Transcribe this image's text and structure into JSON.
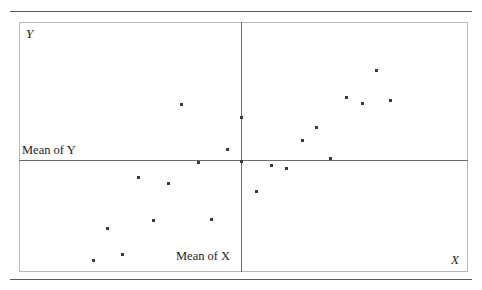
{
  "figure": {
    "background": "#ffffff",
    "rules": {
      "color": "#5a5a5a",
      "top_label": "top-rule",
      "bottom_label": "bottom-rule"
    },
    "frame_color": "#b9b9b9",
    "mean_line_color": "#6b6b6b",
    "point_color": "#3a3a3a"
  },
  "labels": {
    "y_axis": "Y",
    "x_axis": "X",
    "mean_of_y": "Mean of Y",
    "mean_of_x": "Mean of X"
  },
  "chart_data": {
    "type": "scatter",
    "title": "",
    "subtitle": "",
    "xlabel": "X",
    "ylabel": "Y",
    "xlim": [
      0,
      100
    ],
    "ylim": [
      0,
      100
    ],
    "grid": false,
    "legend": null,
    "annotations": [
      {
        "text": "Mean of Y",
        "kind": "horizontal-reference-line-label",
        "line_value_y": 44.8,
        "position": "left-above-line"
      },
      {
        "text": "Mean of X",
        "kind": "vertical-reference-line-label",
        "line_value_x": 49.4,
        "position": "bottom-left-of-line"
      }
    ],
    "reference_lines": [
      {
        "name": "mean-of-y",
        "orientation": "horizontal",
        "value": 44.8
      },
      {
        "name": "mean-of-x",
        "orientation": "vertical",
        "value": 49.4
      }
    ],
    "series": [
      {
        "name": "observations",
        "marker": "square",
        "color": "#3a3a3a",
        "points": [
          {
            "x": 16.5,
            "y": 4.8,
            "px": 93,
            "py": 260,
            "quadrant": "lower-left"
          },
          {
            "x": 19.6,
            "y": 17.6,
            "px": 107,
            "py": 228,
            "quadrant": "lower-left"
          },
          {
            "x": 22.9,
            "y": 7.2,
            "px": 122,
            "py": 254,
            "quadrant": "lower-left"
          },
          {
            "x": 26.5,
            "y": 38.0,
            "px": 138,
            "py": 177,
            "quadrant": "lower-left"
          },
          {
            "x": 29.8,
            "y": 20.8,
            "px": 153,
            "py": 220,
            "quadrant": "lower-left"
          },
          {
            "x": 33.2,
            "y": 35.6,
            "px": 168,
            "py": 183,
            "quadrant": "lower-left"
          },
          {
            "x": 36.1,
            "y": 67.2,
            "px": 181,
            "py": 104,
            "quadrant": "upper-left"
          },
          {
            "x": 39.9,
            "y": 44.0,
            "px": 198,
            "py": 162,
            "quadrant": "lower-left"
          },
          {
            "x": 42.8,
            "y": 21.2,
            "px": 211,
            "py": 219,
            "quadrant": "lower-left"
          },
          {
            "x": 46.3,
            "y": 49.2,
            "px": 227,
            "py": 149,
            "quadrant": "lower-left"
          },
          {
            "x": 49.4,
            "y": 62.0,
            "px": 241,
            "py": 117,
            "quadrant": "on-mean-x"
          },
          {
            "x": 49.4,
            "y": 44.4,
            "px": 241,
            "py": 161,
            "quadrant": "intersection"
          },
          {
            "x": 52.8,
            "y": 32.4,
            "px": 256,
            "py": 191,
            "quadrant": "lower-right"
          },
          {
            "x": 56.1,
            "y": 42.8,
            "px": 271,
            "py": 165,
            "quadrant": "lower-right"
          },
          {
            "x": 59.5,
            "y": 41.6,
            "px": 286,
            "py": 168,
            "quadrant": "lower-right"
          },
          {
            "x": 63.0,
            "y": 52.8,
            "px": 302,
            "py": 140,
            "quadrant": "upper-right"
          },
          {
            "x": 66.1,
            "y": 58.0,
            "px": 316,
            "py": 127,
            "quadrant": "upper-right"
          },
          {
            "x": 69.3,
            "y": 45.6,
            "px": 330,
            "py": 158,
            "quadrant": "upper-right"
          },
          {
            "x": 72.8,
            "y": 70.0,
            "px": 346,
            "py": 97,
            "quadrant": "upper-right"
          },
          {
            "x": 76.4,
            "y": 67.6,
            "px": 362,
            "py": 103,
            "quadrant": "upper-right"
          },
          {
            "x": 79.5,
            "y": 80.8,
            "px": 376,
            "py": 70,
            "quadrant": "upper-right"
          },
          {
            "x": 82.6,
            "y": 68.4,
            "px": 390,
            "py": 100,
            "quadrant": "upper-right"
          }
        ]
      }
    ]
  }
}
